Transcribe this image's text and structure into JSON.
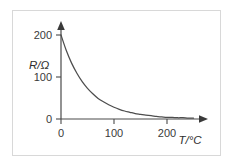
{
  "chart_data": {
    "type": "line",
    "title": "",
    "subtitle": "",
    "xlabel": "T/°C",
    "ylabel": "R/Ω",
    "xlim": [
      0,
      250
    ],
    "ylim": [
      0,
      215
    ],
    "grid": false,
    "legend": null,
    "annotations": [],
    "x_ticks": [
      0,
      100,
      200
    ],
    "x_tick_labels": [
      "0",
      "100",
      "200"
    ],
    "y_ticks": [
      0,
      100,
      200
    ],
    "y_tick_labels": [
      "0",
      "100",
      "200"
    ],
    "series": [
      {
        "name": "Thermistor resistance",
        "x": [
          0,
          10,
          20,
          30,
          40,
          50,
          60,
          70,
          80,
          90,
          100,
          110,
          120,
          130,
          140,
          150,
          160,
          170,
          180,
          190,
          200,
          210,
          220,
          230,
          240,
          250
        ],
        "values": [
          200,
          163,
          133,
          109,
          89,
          73,
          60,
          49,
          41,
          34,
          28,
          23,
          19,
          16,
          13,
          11,
          9,
          8,
          6,
          5,
          4,
          4,
          3,
          3,
          2,
          2
        ]
      }
    ],
    "curve_color": "#4d4d4d",
    "axis_color": "#4a4a4a",
    "border_color": "#d8d8d8",
    "background_color": "#ffffff"
  },
  "axis_labels": {
    "y_title": "R/Ω",
    "x_title": "T/°C",
    "y_tick_200": "200",
    "y_tick_100": "100",
    "y_tick_0": "0",
    "x_tick_0": "0",
    "x_tick_100": "100",
    "x_tick_200": "200"
  }
}
